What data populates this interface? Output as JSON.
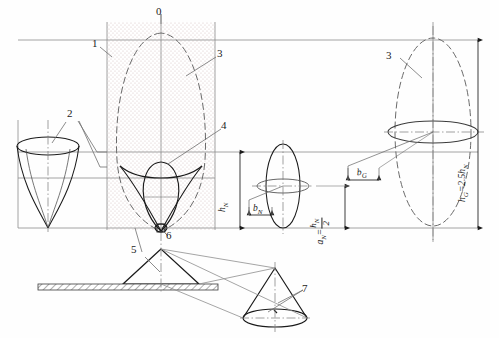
{
  "figure": {
    "background_color": "#fefefe",
    "line_color": "#1b1b1b",
    "hatch_color": "#9a9a9a",
    "dotted_fill_color": "#d9c9c9"
  },
  "callouts": [
    {
      "id": "c0",
      "label": "0",
      "x": 158,
      "y": 9,
      "leader": true
    },
    {
      "id": "c1",
      "label": "1",
      "x": 93,
      "y": 40,
      "leader": true
    },
    {
      "id": "c3a",
      "label": "3",
      "x": 219,
      "y": 50,
      "leader": true
    },
    {
      "id": "c2",
      "label": "2",
      "x": 69,
      "y": 110,
      "leader": true
    },
    {
      "id": "c4",
      "label": "4",
      "x": 223,
      "y": 122,
      "leader": true
    },
    {
      "id": "c3b",
      "label": "3",
      "x": 388,
      "y": 52,
      "leader": true
    },
    {
      "id": "c6",
      "label": "6",
      "x": 168,
      "y": 232,
      "leader": true
    },
    {
      "id": "c5",
      "label": "5",
      "x": 133,
      "y": 246,
      "leader": true
    },
    {
      "id": "c7",
      "label": "7",
      "x": 304,
      "y": 285,
      "leader": true
    }
  ],
  "dimensions": {
    "h_sub_n": {
      "symbol": "h",
      "subscript": "N",
      "orientation": "vertical",
      "x": 229,
      "y": 196
    },
    "b_sub_n": {
      "symbol": "b",
      "subscript": "N",
      "orientation": "horizontal",
      "x": 246,
      "y": 213
    },
    "a_sub_n": {
      "symbol": "a",
      "subscript": "N",
      "equals": "=",
      "numerator": "h",
      "numerator_sub": "N",
      "denominator": "2",
      "orientation": "vertical",
      "x": 331,
      "y": 215
    },
    "b_sub_g": {
      "symbol": "b",
      "subscript": "G",
      "orientation": "horizontal",
      "x": 360,
      "y": 170
    },
    "h_sub_g": {
      "symbol": "h",
      "subscript": "G",
      "equals": "=",
      "factor": "2.5",
      "ref_symbol": "h",
      "ref_subscript": "N",
      "orientation": "vertical",
      "x": 478,
      "y": 186
    }
  },
  "legend_items": [
    {
      "number": "0",
      "meaning": "axis-zero-reference"
    },
    {
      "number": "1",
      "meaning": "vertical-band-boundary"
    },
    {
      "number": "2",
      "meaning": "horn-funnel"
    },
    {
      "number": "3",
      "meaning": "main-lobe-envelope"
    },
    {
      "number": "4",
      "meaning": "inner-lobe"
    },
    {
      "number": "5",
      "meaning": "ground-cone"
    },
    {
      "number": "6",
      "meaning": "apex-node"
    },
    {
      "number": "7",
      "meaning": "projected-cone"
    }
  ]
}
